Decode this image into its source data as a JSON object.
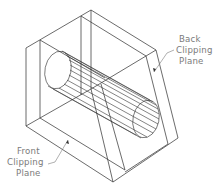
{
  "figure": {
    "labels": {
      "back": [
        "Back",
        "Clipping",
        "Plane"
      ],
      "front": [
        "Front",
        "Clipping",
        "Plane"
      ]
    },
    "colors": {
      "line": "#3a3a3a",
      "label": "#7a7a7a",
      "background": "#ffffff"
    }
  }
}
